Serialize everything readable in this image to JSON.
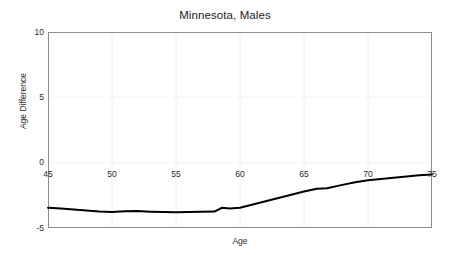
{
  "chart_data": {
    "type": "line",
    "title": "Minnesota, Males",
    "xlabel": "Age",
    "ylabel": "Age Difference",
    "xlim": [
      45,
      75
    ],
    "ylim": [
      -5,
      10
    ],
    "xticks": [
      45,
      50,
      55,
      60,
      65,
      70,
      75
    ],
    "yticks": [
      10,
      5,
      0,
      -5
    ],
    "xtick_labels": [
      "45",
      "50",
      "55",
      "60",
      "65",
      "70",
      "75"
    ],
    "ytick_labels": [
      "10",
      "5",
      "0",
      "-5"
    ],
    "grid": true,
    "legend": "none",
    "series": [
      {
        "name": "Age Difference",
        "color": "#000000",
        "x": [
          45,
          46,
          47,
          48,
          49,
          50,
          51,
          52,
          53,
          54,
          55,
          56,
          57,
          58,
          58.6,
          59.2,
          60,
          61,
          62,
          63,
          64,
          65,
          66,
          66.8,
          68,
          69,
          70,
          71,
          72,
          73,
          74,
          75
        ],
        "y": [
          -3.45,
          -3.5,
          -3.58,
          -3.67,
          -3.74,
          -3.78,
          -3.72,
          -3.7,
          -3.75,
          -3.78,
          -3.8,
          -3.78,
          -3.75,
          -3.74,
          -3.45,
          -3.5,
          -3.45,
          -3.2,
          -2.95,
          -2.7,
          -2.45,
          -2.2,
          -2.0,
          -1.95,
          -1.7,
          -1.5,
          -1.35,
          -1.25,
          -1.15,
          -1.05,
          -0.97,
          -0.9
        ]
      }
    ]
  },
  "figure": {
    "background": "#ffffff",
    "frame_color": "#8c8c8c",
    "grid_color": "#f2f2f2",
    "text_color": "#2b2b2b",
    "title_color": "#1a1a1a",
    "line_color": "#000000",
    "line_width": 2.0
  },
  "plot_box": {
    "left": 48,
    "top": 32,
    "right": 432,
    "bottom": 228
  }
}
